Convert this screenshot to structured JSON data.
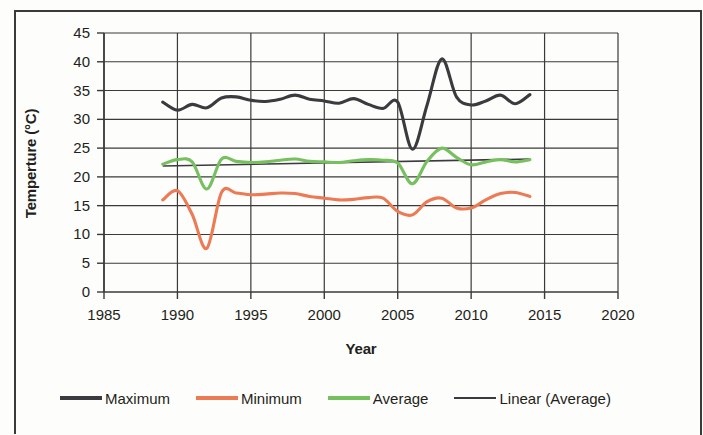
{
  "chart_data": {
    "type": "line",
    "title": "",
    "xlabel": "Year",
    "ylabel": "Temperture (°C)",
    "xlim": [
      1985,
      2020
    ],
    "ylim": [
      0,
      45
    ],
    "xticks": [
      1985,
      1990,
      1995,
      2000,
      2005,
      2010,
      2015,
      2020
    ],
    "yticks": [
      0,
      5,
      10,
      15,
      20,
      25,
      30,
      35,
      40,
      45
    ],
    "grid": true,
    "legend_position": "bottom",
    "x": [
      1989,
      1990,
      1991,
      1992,
      1993,
      1994,
      1995,
      1996,
      1997,
      1998,
      1999,
      2000,
      2001,
      2002,
      2003,
      2004,
      2005,
      2006,
      2007,
      2008,
      2009,
      2010,
      2011,
      2012,
      2013,
      2014
    ],
    "series": [
      {
        "name": "Maximum",
        "color": "#3b3b3f",
        "values": [
          33.0,
          31.6,
          32.6,
          32.0,
          33.7,
          33.9,
          33.3,
          33.1,
          33.5,
          34.2,
          33.5,
          33.2,
          32.8,
          33.6,
          32.6,
          31.9,
          33.0,
          24.8,
          32.5,
          40.5,
          33.9,
          32.5,
          33.2,
          34.2,
          32.7,
          34.3
        ]
      },
      {
        "name": "Minimum",
        "color": "#ec7b55",
        "values": [
          16.0,
          17.6,
          13.5,
          7.6,
          17.3,
          17.2,
          16.9,
          17.0,
          17.2,
          17.1,
          16.6,
          16.3,
          16.0,
          16.1,
          16.4,
          16.3,
          14.0,
          13.4,
          15.7,
          16.3,
          14.6,
          14.6,
          16.0,
          17.1,
          17.3,
          16.6
        ]
      },
      {
        "name": "Average",
        "color": "#77c05f",
        "values": [
          22.2,
          23.0,
          22.6,
          17.9,
          23.1,
          22.7,
          22.5,
          22.6,
          22.9,
          23.1,
          22.7,
          22.6,
          22.5,
          22.8,
          23.0,
          22.9,
          22.4,
          18.8,
          22.7,
          25.0,
          23.4,
          22.1,
          22.6,
          23.0,
          22.6,
          23.0
        ]
      }
    ],
    "trendline": {
      "name": "Linear (Average)",
      "color": "#3b3b3f",
      "x": [
        1989,
        2014
      ],
      "values": [
        21.9,
        23.1
      ]
    }
  },
  "legend": {
    "items": [
      {
        "label": "Maximum",
        "color": "#3b3b3f",
        "thin": false
      },
      {
        "label": "Minimum",
        "color": "#ec7b55",
        "thin": false
      },
      {
        "label": "Average",
        "color": "#77c05f",
        "thin": false
      },
      {
        "label": "Linear (Average)",
        "color": "#3b3b3f",
        "thin": true
      }
    ]
  },
  "axes": {
    "y_title": "Temperture (°C)",
    "x_title": "Year",
    "y_tick_labels": [
      "45",
      "40",
      "35",
      "30",
      "25",
      "20",
      "15",
      "10",
      "5",
      "0"
    ],
    "x_tick_labels": [
      "1985",
      "1990",
      "1995",
      "2000",
      "2005",
      "2010",
      "2015",
      "2020"
    ]
  }
}
